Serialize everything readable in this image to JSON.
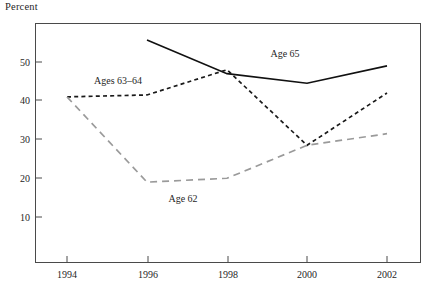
{
  "chart_data": {
    "type": "line",
    "title": "",
    "ylabel": "Percent",
    "xlabel": "",
    "x": [
      1994,
      1996,
      1998,
      2000,
      2002
    ],
    "xtick_labels": [
      "1994",
      "1996",
      "1998",
      "2000",
      "2002"
    ],
    "ytick_labels": [
      "10",
      "20",
      "30",
      "40",
      "50"
    ],
    "ytick_values": [
      10,
      20,
      30,
      40,
      50
    ],
    "ylim": [
      0,
      60
    ],
    "xlim": [
      1993,
      2003
    ],
    "grid": false,
    "legend": "inline-annotations",
    "series": [
      {
        "name": "Age 65",
        "label": "Age 65",
        "style": "solid",
        "color": "#111111",
        "x": [
          1996,
          1998,
          2000,
          2002
        ],
        "values": [
          55.7,
          47.0,
          44.5,
          49.0
        ]
      },
      {
        "name": "Ages 63-64",
        "label": "Ages 63–64",
        "style": "dashed",
        "color": "#1a1a1a",
        "x": [
          1994,
          1996,
          1998,
          2000,
          2002
        ],
        "values": [
          41.0,
          41.5,
          48.0,
          28.5,
          42.0
        ]
      },
      {
        "name": "Age 62",
        "label": "Age 62",
        "style": "dashed",
        "color": "#9a9a9a",
        "x": [
          1994,
          1996,
          1998,
          2000,
          2002
        ],
        "values": [
          41.0,
          19.0,
          20.0,
          28.5,
          31.5
        ]
      }
    ],
    "annotations": [
      {
        "text": "Ages 63–64",
        "x": 118,
        "y": 84
      },
      {
        "text": "Age 65",
        "x": 285,
        "y": 57
      },
      {
        "text": "Age 62",
        "x": 183,
        "y": 202
      }
    ],
    "colors": {
      "axis": "#4a4a4a",
      "solid_series": "#111111",
      "dashed_black_series": "#1a1a1a",
      "dashed_gray_series": "#9a9a9a",
      "text": "#1f1f1f"
    }
  }
}
